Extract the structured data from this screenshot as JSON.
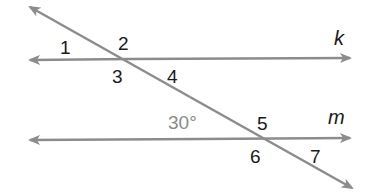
{
  "diagram": {
    "line_color": "#8c8c8c",
    "text_color": "#1a1a1a",
    "given_color": "#8a8a8a",
    "lines": {
      "k": {
        "label": "k",
        "x1": 30,
        "y1": 60,
        "x2": 350,
        "y2": 58
      },
      "m": {
        "label": "m",
        "x1": 30,
        "y1": 140,
        "x2": 350,
        "y2": 138
      },
      "transversal": {
        "x1": 30,
        "y1": 7,
        "x2": 352,
        "y2": 188
      }
    },
    "angles": [
      {
        "id": "1",
        "label": "1"
      },
      {
        "id": "2",
        "label": "2"
      },
      {
        "id": "3",
        "label": "3"
      },
      {
        "id": "4",
        "label": "4"
      },
      {
        "id": "5",
        "label": "5"
      },
      {
        "id": "6",
        "label": "6"
      },
      {
        "id": "7",
        "label": "7"
      }
    ],
    "given_angle": {
      "label": "30°"
    }
  }
}
